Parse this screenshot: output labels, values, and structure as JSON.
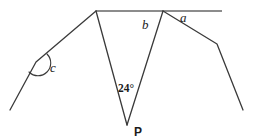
{
  "figure": {
    "type": "geometry-diagram",
    "background_color": "#ffffff",
    "stroke_color": "#3a3a3a",
    "baseline_color": "#8c8c8c",
    "label_color": "#1b1b1b",
    "baseline": {
      "name": "horizontal-reference-line",
      "x1": 96,
      "y1": 11,
      "x2": 222,
      "y2": 11,
      "stroke_width": 2.2
    },
    "paths": [
      {
        "name": "left-polyline",
        "points": [
          [
            10,
            110
          ],
          [
            36,
            62
          ],
          [
            96,
            11
          ]
        ],
        "stroke_width": 1.3
      },
      {
        "name": "triangle-left-leg",
        "points": [
          [
            96,
            11
          ],
          [
            127,
            125
          ]
        ],
        "stroke_width": 1.3
      },
      {
        "name": "triangle-right-leg",
        "points": [
          [
            127,
            125
          ],
          [
            163,
            11
          ]
        ],
        "stroke_width": 1.3
      },
      {
        "name": "right-polyline",
        "points": [
          [
            163,
            11
          ],
          [
            217,
            44
          ],
          [
            243,
            110
          ]
        ],
        "stroke_width": 1.3
      }
    ],
    "angle_arcs": [
      {
        "name": "angle-arc-c",
        "vertex": [
          36,
          62
        ],
        "path": "M 47 54 A 12 12 0 1 1 29 72",
        "stroke_width": 1.1
      }
    ],
    "labels": [
      {
        "name": "angle-label-c",
        "text": "c",
        "x": 50,
        "y": 72,
        "style": "angle"
      },
      {
        "name": "angle-label-b",
        "text": "b",
        "x": 142,
        "y": 29,
        "style": "angle"
      },
      {
        "name": "angle-label-a",
        "text": "a",
        "x": 180,
        "y": 22,
        "style": "angle"
      },
      {
        "name": "angle-measure-24",
        "text": "24°",
        "x": 118,
        "y": 92,
        "style": "measure"
      },
      {
        "name": "point-label-p",
        "text": "P",
        "x": 134,
        "y": 136,
        "style": "point"
      }
    ]
  }
}
